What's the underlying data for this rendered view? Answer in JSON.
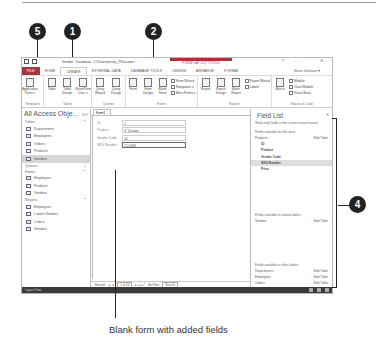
{
  "callouts": [
    "5",
    "1",
    "2",
    "4"
  ],
  "caption": "Blank form with added fields",
  "window": {
    "title": "Vendor : Database- C:\\Users\\jenny_2\\Docume...",
    "context_tab_group": "FORM LAYOUT TOOLS",
    "controls": "? – ▫ ✕",
    "user": "Steve Johnson ▾"
  },
  "ribbon": {
    "tabs": [
      {
        "label": "FILE"
      },
      {
        "label": "HOME"
      },
      {
        "label": "CREATE"
      },
      {
        "label": "EXTERNAL DATA"
      },
      {
        "label": "DATABASE TOOLS"
      },
      {
        "label": "DESIGN"
      },
      {
        "label": "ARRANGE"
      },
      {
        "label": "FORMAT"
      }
    ],
    "groups": [
      {
        "label": "Templates",
        "buttons": [
          "Application Parts ▾"
        ]
      },
      {
        "label": "Tables",
        "buttons": [
          "Table",
          "Table Design",
          "SharePoint Lists ▾"
        ]
      },
      {
        "label": "Queries",
        "buttons": [
          "Query Wizard",
          "Query Design"
        ]
      },
      {
        "label": "Forms",
        "buttons": [
          "Form",
          "Form Design",
          "Blank Form"
        ],
        "small": [
          "Form Wizard",
          "Navigation ▾",
          "More Forms ▾"
        ]
      },
      {
        "label": "Reports",
        "buttons": [
          "Report",
          "Report Design",
          "Blank Report"
        ],
        "small": [
          "Report Wizard",
          "Labels"
        ]
      },
      {
        "label": "Macros & Code",
        "buttons": [
          "Macro"
        ],
        "small": [
          "Module",
          "Class Module",
          "Visual Basic"
        ]
      }
    ]
  },
  "nav": {
    "title": "All Access Obje...",
    "sections": [
      {
        "label": "Tables",
        "items": [
          "Departments",
          "Employees",
          "Orders",
          "Products",
          "Vendors"
        ],
        "selected": 4
      },
      {
        "label": "Queries",
        "items": []
      },
      {
        "label": "Forms",
        "items": [
          "Employees",
          "Products",
          "Vendors"
        ]
      },
      {
        "label": "Reports",
        "items": [
          "Employees",
          "Labels Vendors",
          "Orders",
          "Vendors"
        ]
      }
    ]
  },
  "document": {
    "tab": "Form1",
    "fields": [
      {
        "label": "ID",
        "value": "1"
      },
      {
        "label": "Product",
        "value": "3\" Drawer"
      },
      {
        "label": "Vendor Code",
        "value": "GL"
      },
      {
        "label": "SKU Number",
        "value": "CL2468"
      }
    ],
    "record_nav": {
      "label": "Record:",
      "position": "1 of 16",
      "filter": "No Filter",
      "search": "Search"
    }
  },
  "field_list": {
    "title": "Field List",
    "note": "Show only fields in the current record source",
    "this_view_header": "Fields available for this view:",
    "table": "Products",
    "edit_table": "Edit Table",
    "fields": [
      "ID",
      "Product",
      "Vendor Code",
      "SKU Number",
      "Price"
    ],
    "selected_field": 3,
    "related_header": "Fields available in related tables:",
    "related": [
      {
        "name": "Vendors",
        "action": "Edit Table"
      }
    ],
    "other_header": "Fields available in other tables:",
    "other": [
      {
        "name": "Departments",
        "action": "Edit Table"
      },
      {
        "name": "Employees",
        "action": "Edit Table"
      },
      {
        "name": "Orders",
        "action": "Edit Table"
      },
      {
        "name": "TempEmployees",
        "action": "Edit Table"
      }
    ]
  },
  "statusbar": {
    "text": "Layout View"
  }
}
